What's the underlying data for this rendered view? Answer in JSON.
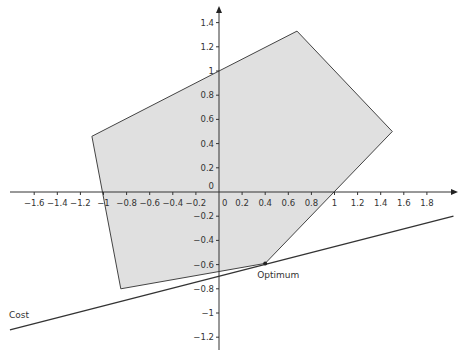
{
  "chart_data": {
    "type": "diagram",
    "title": "",
    "axes": {
      "origin_px": [
        219,
        192
      ],
      "x_scale_px_per_unit": 115.5,
      "y_scale_px_per_unit": 121,
      "x_range": [
        -1.75,
        2.0
      ],
      "y_range": [
        -1.3,
        1.55
      ],
      "x_ticks": [
        -1.6,
        -1.4,
        -1.2,
        -1,
        -0.8,
        -0.6,
        -0.4,
        -0.2,
        0,
        0.2,
        0.4,
        0.6,
        0.8,
        1,
        1.2,
        1.4,
        1.6,
        1.8
      ],
      "x_tick_labels": [
        "−1.6",
        "−1.4",
        "−1.2",
        "−1",
        "−0.8",
        "−0.6",
        "−0.4",
        "−0.2",
        "0",
        "0.2",
        "0.4",
        "0.6",
        "0.8",
        "1",
        "1.2",
        "1.4",
        "1.6",
        "1.8"
      ],
      "y_ticks": [
        1.4,
        1.2,
        1,
        0.8,
        0.6,
        0.4,
        0.2,
        0,
        -0.2,
        -0.4,
        -0.6,
        -0.8,
        -1,
        -1.2
      ],
      "y_tick_labels": [
        "1.4",
        "1.2",
        "1",
        "0.8",
        "0.6",
        "0.4",
        "0.2",
        "0",
        "−0.2",
        "−0.4",
        "−0.6",
        "−0.8",
        "−1",
        "−1.2"
      ],
      "grid": false,
      "arrows": true
    },
    "feasible_region": {
      "vertices": [
        [
          -1.1,
          0.46
        ],
        [
          0,
          1.0
        ],
        [
          0.675,
          1.33
        ],
        [
          1.5,
          0.5
        ],
        [
          0.4,
          -0.59
        ],
        [
          -0.85,
          -0.8
        ]
      ],
      "fill": "#e0e0e0",
      "stroke": "#444444"
    },
    "cost_line": {
      "label": "Cost",
      "points": [
        [
          -1.81,
          -1.14
        ],
        [
          2.03,
          -0.2
        ]
      ],
      "stroke": "#333333"
    },
    "optimum": {
      "label": "Optimum",
      "point": [
        0.4,
        -0.59
      ]
    }
  },
  "labels": {
    "cost": "Cost",
    "optimum": "Optimum"
  }
}
